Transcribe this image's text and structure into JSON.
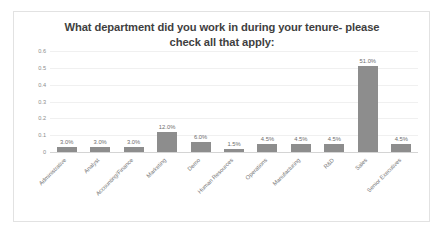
{
  "chart_data": {
    "type": "bar",
    "title": "What department did you work in during your tenure- please check all that apply:",
    "title_line1": "What department did you work in during your tenure-",
    "title_line2": "please check all that apply:",
    "xlabel": "",
    "ylabel": "",
    "ylim": [
      0,
      0.6
    ],
    "ytick_labels": [
      "0.6",
      "0.5",
      "0.4",
      "0.3",
      "0.2",
      "0.1",
      "0"
    ],
    "ytick_values": [
      0.6,
      0.5,
      0.4,
      0.3,
      0.2,
      0.1,
      0
    ],
    "grid": true,
    "legend": false,
    "bar_color": "#8d8d8d",
    "categories": [
      "Administrative",
      "Analyst",
      "Accounting/Finance",
      "Marketing",
      "Demo",
      "Human Resources",
      "Operations",
      "Manufacturing",
      "R&D",
      "Sales",
      "Senior Executives"
    ],
    "values": [
      0.03,
      0.03,
      0.03,
      0.12,
      0.06,
      0.015,
      0.045,
      0.045,
      0.045,
      0.51,
      0.045
    ],
    "data_labels": [
      "3.0%",
      "3.0%",
      "3.0%",
      "12.0%",
      "6.0%",
      "1.5%",
      "4.5%",
      "4.5%",
      "4.5%",
      "51.0%",
      "4.5%"
    ]
  }
}
